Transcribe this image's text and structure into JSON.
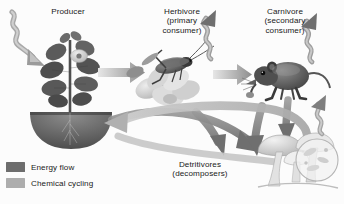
{
  "figure": {
    "type": "ecosystem-energy-flow-diagram",
    "background_color": "#fcfcfc",
    "text_color": "#1a1a1a"
  },
  "labels": {
    "producer": "Producer",
    "herbivore": "Herbivore\n(primary\nconsumer)",
    "carnivore": "Carnivore\n(secondary\nconsumer)",
    "detritivores": "Detritivores\n(decomposers)"
  },
  "legend": {
    "items": [
      {
        "label": "Energy flow",
        "color": "#6d6d6d",
        "icon": "square-swatch-icon"
      },
      {
        "label": "Chemical cycling",
        "color": "#adadad",
        "icon": "square-swatch-icon"
      }
    ]
  },
  "organisms": [
    {
      "name": "plant",
      "role": "producer",
      "icon": "leafy-plant-icon"
    },
    {
      "name": "soil-mound",
      "role": "soil",
      "icon": "soil-mound-icon"
    },
    {
      "name": "grasshopper-on-flower",
      "role": "herbivore",
      "icon": "grasshopper-icon"
    },
    {
      "name": "mouse",
      "role": "carnivore",
      "icon": "mouse-icon"
    },
    {
      "name": "mushrooms",
      "role": "detritivore",
      "icon": "mushroom-cluster-icon"
    },
    {
      "name": "microbe-inset",
      "role": "detritivore-magnification",
      "icon": "magnifier-circle-icon"
    }
  ],
  "arrows": {
    "energy_flow_color": "#7a7a7a",
    "chemical_cycling_color": "#b4b4b4",
    "sunlight_in": "squiggly-arrow-down-right",
    "heat_loss_herbivore": "squiggly-arrow-up-right",
    "heat_loss_carnivore": "squiggly-arrow-up-right",
    "heat_loss_detritivores": "squiggly-arrow-up-right",
    "producer_to_herbivore": "straight-arrow-right",
    "herbivore_to_carnivore": "straight-arrow-right",
    "to_detritivores_count": 3,
    "detritivores_to_soil": "curved-arrow-left"
  }
}
